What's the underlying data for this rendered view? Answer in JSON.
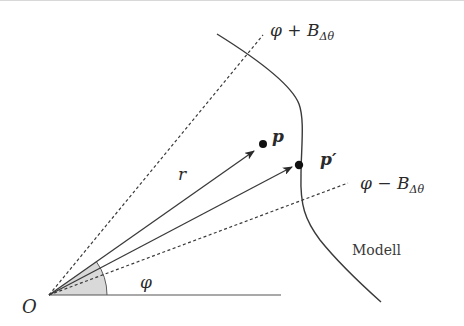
{
  "diagram": {
    "type": "geometric-construction",
    "colors": {
      "stroke": "#3a3a3a",
      "sector_fill": "#d9d9d9",
      "point": "#111111",
      "background": "#ffffff"
    },
    "labels": {
      "origin": "O",
      "angle": "φ",
      "radius": "r",
      "point_p": "p",
      "point_p_prime": "p′",
      "upper_bound_prefix": "φ + B",
      "upper_bound_sub": "Δθ",
      "lower_bound_prefix": "φ − B",
      "lower_bound_sub": "Δθ",
      "model": "Modell"
    },
    "elements": {
      "origin": [
        49,
        295
      ],
      "baseline_end": [
        281,
        295
      ],
      "upper_dashed_end": [
        263,
        35
      ],
      "lower_dashed_end": [
        348,
        183
      ],
      "arrow_r_end": [
        254,
        151
      ],
      "arrow_p_prime_end": [
        292,
        167
      ],
      "point_p": [
        263,
        144
      ],
      "point_p_prime": [
        299,
        165
      ],
      "sector_radius": 58,
      "model_curve": "M217,34 C262,62 292,86 299,104 C305,120 301,150 301,175 C300,205 305,220 320,240 C340,265 362,285 381,302"
    }
  }
}
